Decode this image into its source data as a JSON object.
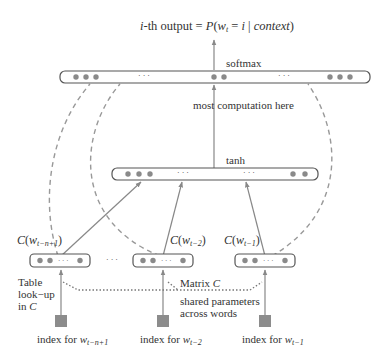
{
  "title": {
    "prefix_italic": "i",
    "prefix": "-th output = ",
    "P": "P",
    "open": "(",
    "w": "w",
    "w_sub": "t",
    "eq": " = ",
    "i": "i",
    "bar": " | ",
    "context": "context",
    "close": ")"
  },
  "layers": {
    "softmax": {
      "label": "softmax",
      "ellipsis_left": "· · ·",
      "ellipsis_right": "· · ·"
    },
    "hidden": {
      "label": "tanh",
      "ellipsis_left": "· · ·",
      "ellipsis_right": "· · ·"
    },
    "annotation": "most computation here"
  },
  "embeddings": [
    {
      "func": "C",
      "arg": "w",
      "sub": "t−n+1",
      "inner_ellipsis": "· · ·",
      "index_label": "index for ",
      "index_w": "w",
      "index_sub": "t−n+1"
    },
    {
      "func": "C",
      "arg": "w",
      "sub": "t−2",
      "inner_ellipsis": "· · ·",
      "index_label": "index for ",
      "index_w": "w",
      "index_sub": "t−2"
    },
    {
      "func": "C",
      "arg": "w",
      "sub": "t−1",
      "inner_ellipsis": "· · ·",
      "index_label": "index for ",
      "index_w": "w",
      "index_sub": "t−1"
    }
  ],
  "between_embeddings_ellipsis": "· · ·",
  "table_lookup": {
    "line1": "Table",
    "line2": "look−up",
    "line3_prefix": "in ",
    "line3_var": "C"
  },
  "matrix": {
    "prefix": "Matrix ",
    "var": "C"
  },
  "shared": {
    "line1": "shared parameters",
    "line2": "across words"
  },
  "colors": {
    "line": "#888888",
    "dot": "#8a8a8a",
    "box_stroke": "#555555",
    "index_square": "#8c8c8c",
    "text": "#333333"
  }
}
